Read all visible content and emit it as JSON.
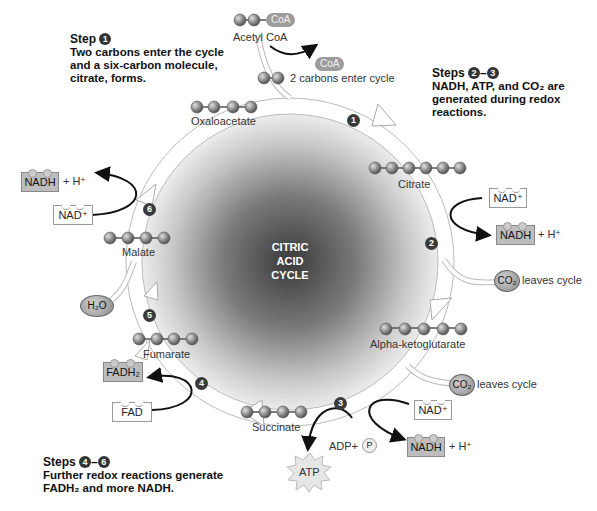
{
  "title": "Citric Acid Cycle",
  "center": {
    "line1": "CITRIC",
    "line2": "ACID",
    "line3": "CYCLE"
  },
  "annotations": {
    "step1": {
      "title": "Step",
      "badge": "1",
      "line1": "Two carbons enter the cycle",
      "line2": "and a six-carbon molecule,",
      "line3": "citrate, forms."
    },
    "steps23": {
      "title": "Steps",
      "badge_a": "2",
      "dash": "–",
      "badge_b": "3",
      "line1": "NADH, ATP, and CO₂ are",
      "line2": "generated during redox",
      "line3": "reactions."
    },
    "steps46": {
      "title": "Steps",
      "badge_a": "4",
      "dash": "–",
      "badge_b": "6",
      "line1": "Further redox reactions generate",
      "line2": "FADH₂ and more NADH."
    }
  },
  "molecules": {
    "acetyl_coa": {
      "label": "Acetyl CoA",
      "coa": "CoA",
      "carbons": 2
    },
    "coa_released": {
      "label": "CoA"
    },
    "two_carbons": {
      "label": "2 carbons enter cycle",
      "carbons": 2
    },
    "oxaloacetate": {
      "label": "Oxaloacetate",
      "carbons": 4
    },
    "citrate": {
      "label": "Citrate",
      "carbons": 6
    },
    "alpha_ketoglutarate": {
      "label": "Alpha-ketoglutarate",
      "carbons": 5
    },
    "succinate": {
      "label": "Succinate",
      "carbons": 4
    },
    "fumarate": {
      "label": "Fumarate",
      "carbons": 4
    },
    "malate": {
      "label": "Malate",
      "carbons": 4
    }
  },
  "cofactors": {
    "nad_plus": "NAD⁺",
    "nadh": "NADH",
    "h_plus": "+ H⁺",
    "fad": "FAD",
    "fadh2": "FADH₂",
    "co2": "CO₂",
    "co2_leaves": "leaves cycle",
    "h2o": "H₂O",
    "adp": "ADP+",
    "p": "P",
    "atp": "ATP"
  },
  "cycle_steps": [
    "1",
    "2",
    "3",
    "4",
    "5",
    "6"
  ],
  "colors": {
    "sphere_dark": "#3c3c3c",
    "sphere_light": "#efefef",
    "badge": "#333333",
    "nadh_fill": "#bdbdbd"
  }
}
